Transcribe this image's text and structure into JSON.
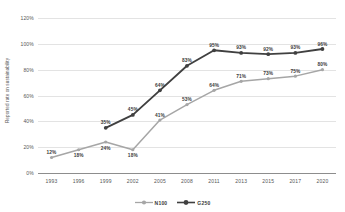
{
  "chart_data": {
    "type": "line",
    "title": "",
    "xlabel": "",
    "ylabel": "Reported rate on sustainability",
    "categories": [
      "1993",
      "1996",
      "1999",
      "2002",
      "2005",
      "2008",
      "2011",
      "2013",
      "2015",
      "2017",
      "2020"
    ],
    "ylim": [
      0,
      120
    ],
    "yticks": [
      "0%",
      "20%",
      "40%",
      "60%",
      "80%",
      "100%",
      "120%"
    ],
    "ytick_values": [
      0,
      20,
      40,
      60,
      80,
      100,
      120
    ],
    "grid": true,
    "legend_position": "bottom",
    "series": [
      {
        "name": "N100",
        "color": "#a6a6a6",
        "values": [
          12,
          18,
          24,
          18,
          41,
          53,
          64,
          71,
          73,
          75,
          80
        ],
        "labels": [
          "12%",
          "18%",
          "24%",
          "18%",
          "41%",
          "53%",
          "64%",
          "71%",
          "73%",
          "75%",
          "80%"
        ]
      },
      {
        "name": "G250",
        "color": "#404040",
        "values": [
          null,
          null,
          35,
          45,
          64,
          83,
          95,
          93,
          92,
          93,
          96
        ],
        "labels": [
          "",
          "",
          "35%",
          "45%",
          "64%",
          "83%",
          "95%",
          "93%",
          "92%",
          "93%",
          "96%"
        ]
      }
    ]
  }
}
